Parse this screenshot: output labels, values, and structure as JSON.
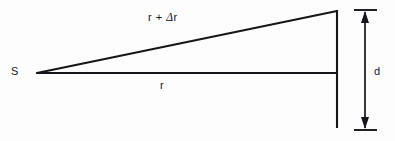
{
  "figure": {
    "kind": "geometry-diagram",
    "background_color": "#fdfdfd",
    "stroke_color": "#15151a",
    "width": 395,
    "height": 141,
    "labels": {
      "source_point": "S",
      "hypotenuse_pre": "r + ",
      "hypotenuse_delta": "Δ",
      "hypotenuse_post": "r",
      "hypotenuse_full": "r + Δr",
      "baseline": "r",
      "dimension": "d"
    },
    "geometry": {
      "apex": {
        "x": 37,
        "y": 73
      },
      "top_corner": {
        "x": 337,
        "y": 11
      },
      "baseline_end": {
        "x": 337,
        "y": 73
      },
      "wall_bottom": {
        "x": 337,
        "y": 128
      },
      "dimension_line_x": 365,
      "dimension_top_y": 10,
      "dimension_bottom_y": 130,
      "tick_half_width": 11
    }
  }
}
